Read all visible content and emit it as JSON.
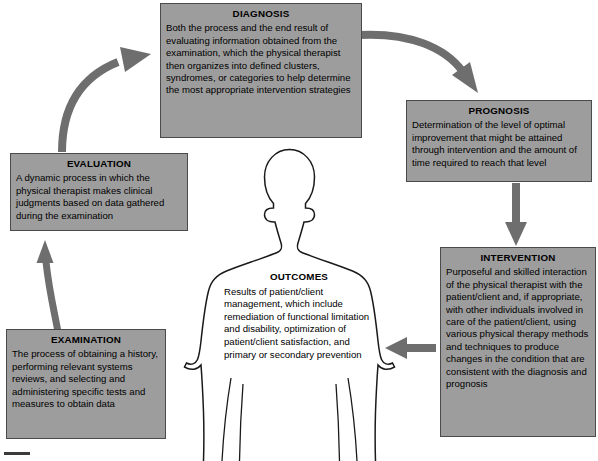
{
  "diagram": {
    "fill_color": "#9d9d9d",
    "arrow_color": "#6e6e6e",
    "outline_color": "#1a1a1a"
  },
  "boxes": {
    "diagnosis": {
      "title": "DIAGNOSIS",
      "body": "Both the process and the end result of evaluating information obtained from the examination, which the physical therapist then organizes into defined clusters, syndromes, or categories to help determine the most appropriate intervention strategies"
    },
    "prognosis": {
      "title": "PROGNOSIS",
      "body": "Determination of the level of optimal improvement that might be attained through intervention and the amount of time required to reach that level"
    },
    "intervention": {
      "title": "INTERVENTION",
      "body": "Purposeful and skilled interaction of the physical therapist with the patient/client and, if appropriate, with other individuals involved in care of the patient/client, using various physical therapy methods and techniques to produce changes in the condition that are consistent with the diagnosis and prognosis"
    },
    "outcomes": {
      "title": "OUTCOMES",
      "body": "Results of patient/client management, which include remediation of functional limitation and disability, optimization of patient/client satisfaction, and primary or secondary prevention"
    },
    "examination": {
      "title": "EXAMINATION",
      "body": "The process of obtaining a history, performing relevant systems reviews, and selecting and administering specific tests and measures to obtain data"
    },
    "evaluation": {
      "title": "EVALUATION",
      "body": "A dynamic process in which the physical therapist makes clinical judgments based on data gathered during the examination"
    }
  },
  "arrows": [
    {
      "name": "evaluation-to-diagnosis",
      "from": "EVALUATION",
      "to": "DIAGNOSIS",
      "shape": "curved"
    },
    {
      "name": "diagnosis-to-prognosis",
      "from": "DIAGNOSIS",
      "to": "PROGNOSIS",
      "shape": "curved"
    },
    {
      "name": "prognosis-to-intervention",
      "from": "PROGNOSIS",
      "to": "INTERVENTION",
      "shape": "straight-down"
    },
    {
      "name": "intervention-to-outcomes",
      "from": "INTERVENTION",
      "to": "OUTCOMES",
      "shape": "straight-left"
    },
    {
      "name": "examination-to-evaluation",
      "from": "EXAMINATION",
      "to": "EVALUATION",
      "shape": "straight-up"
    }
  ]
}
